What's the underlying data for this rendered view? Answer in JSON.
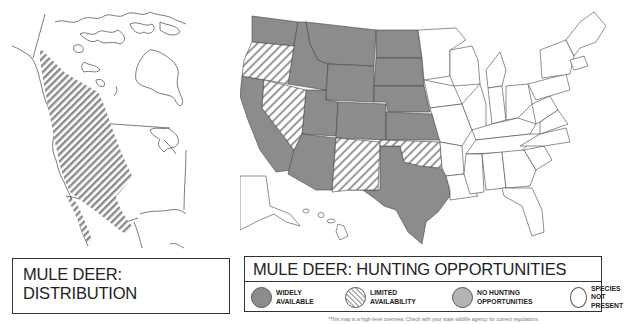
{
  "distribution_map": {
    "title_line1": "MULE DEER:",
    "title_line2": "DISTRIBUTION",
    "range_fill": "hatched",
    "range_color": "#8a8a8a"
  },
  "hunting_map": {
    "title": "MULE DEER: HUNTING OPPORTUNITIES",
    "legend": [
      {
        "key": "widely",
        "line1": "WIDELY",
        "line2": "AVAILABLE",
        "fill": "#8c8c8c",
        "pattern": "solid"
      },
      {
        "key": "limited",
        "line1": "LIMITED",
        "line2": "AVAILABILITY",
        "fill": "#ffffff",
        "pattern": "hatched"
      },
      {
        "key": "none",
        "line1": "NO HUNTING",
        "line2": "OPPORTUNITIES",
        "fill": "#b4b4b4",
        "pattern": "solid"
      },
      {
        "key": "absent",
        "line1": "SPECIES NOT",
        "line2": "PRESENT",
        "fill": "#ffffff",
        "pattern": "none"
      }
    ],
    "states": {
      "widely_available": [
        "WA",
        "ID",
        "MT",
        "WY",
        "ND",
        "SD",
        "NE",
        "KS",
        "CO",
        "UT",
        "CA",
        "AZ",
        "TX"
      ],
      "limited_availability": [
        "OR",
        "NV",
        "NM",
        "OK"
      ],
      "species_not_present": [
        "MN",
        "WI",
        "IA",
        "MO",
        "AR",
        "LA",
        "IL",
        "MI",
        "IN",
        "OH",
        "KY",
        "TN",
        "MS",
        "AL",
        "GA",
        "FL",
        "SC",
        "NC",
        "VA",
        "WV",
        "PA",
        "NY",
        "MD",
        "DE",
        "NJ",
        "CT",
        "RI",
        "MA",
        "VT",
        "NH",
        "ME",
        "AK",
        "HI"
      ]
    }
  },
  "footnote": "*This map is a high-level overview. Check with your state wildlife agency for current regulations."
}
